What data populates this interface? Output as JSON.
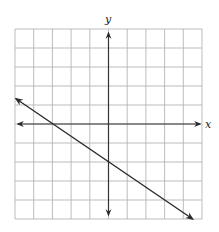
{
  "chart_data": {
    "type": "line",
    "title": "",
    "xlabel": "x",
    "ylabel": "y",
    "xlim": [
      -5,
      5
    ],
    "ylim": [
      -5,
      5
    ],
    "grid": true,
    "grid_step": 1,
    "tick_labels": false,
    "series": [
      {
        "name": "line",
        "equation": "y = -2/3 x - 2",
        "slope": -0.6667,
        "y_intercept": -2,
        "x_intercept": -3,
        "points": [
          [
            -5,
            1.33
          ],
          [
            -3,
            0
          ],
          [
            0,
            -2
          ],
          [
            3,
            -4
          ],
          [
            4.5,
            -5
          ]
        ],
        "arrows": "both ends"
      }
    ]
  },
  "axes": {
    "x_label": "x",
    "y_label": "y"
  },
  "colors": {
    "grid": "#b5b5b5",
    "axis": "#333333",
    "line": "#2a2a2a"
  }
}
